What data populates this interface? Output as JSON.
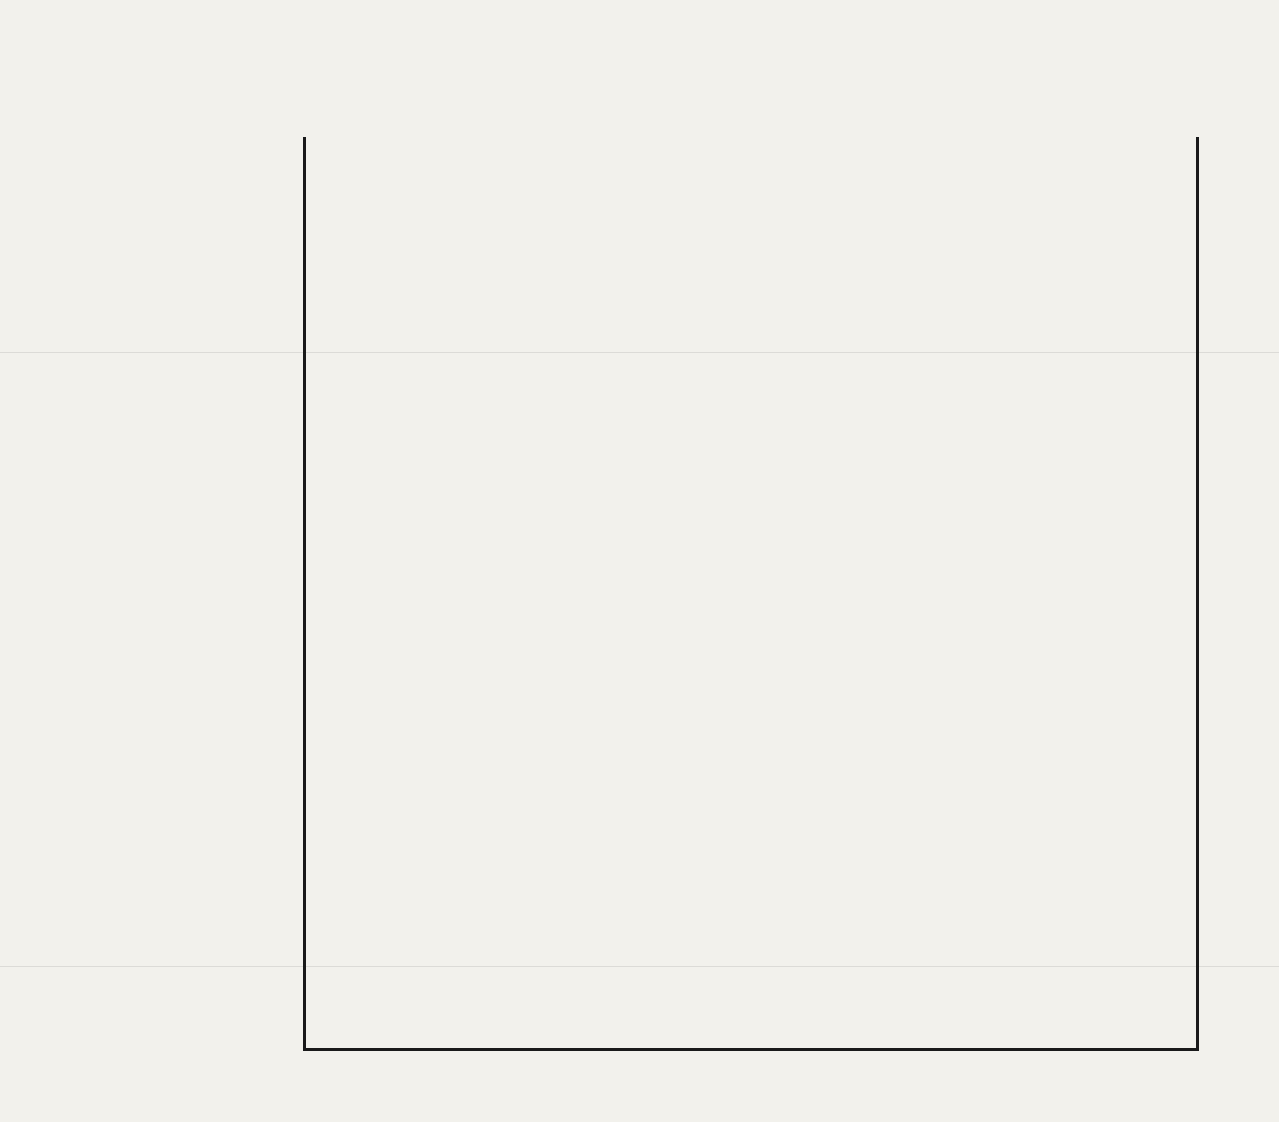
{
  "chart_data": {
    "type": "bar",
    "orientation": "horizontal",
    "xlabel": "Percent",
    "ylabel": "",
    "xlim": [
      0,
      100
    ],
    "xticks": [
      0,
      10,
      20,
      30,
      40,
      50,
      60,
      70,
      80,
      90,
      100
    ],
    "xtick_labels": [
      "0",
      "10",
      "20",
      "30",
      "40",
      "50",
      "60",
      "70",
      "80",
      "90",
      "100"
    ],
    "grid": true,
    "legend": null,
    "bar_color": "#3b3b3b",
    "background_color": "#f2f1ec",
    "axis_color": "#1a1a1a",
    "categories": [
      "Tobacco products",
      "Transportation equip.",
      "Primary metal inds.",
      "Instruments",
      "Chemicals",
      "Electrical machinery",
      "Rubber & plastic prods.",
      "Stone, clay & glass",
      "Machinery, exc. elec.",
      "Foods",
      "Paper",
      "Textiles",
      "Fabricated metal prods.",
      "Miscellaneous mfg.",
      "Apparel",
      "Printing & publishing",
      "Leather",
      "Petroleum & coal prods."
    ],
    "values": [
      100,
      88.5,
      63.5,
      44.8,
      44,
      42,
      37.2,
      36.6,
      18,
      17.2,
      14,
      14,
      12,
      8.5,
      3.8,
      2.5,
      2,
      1.2
    ]
  }
}
